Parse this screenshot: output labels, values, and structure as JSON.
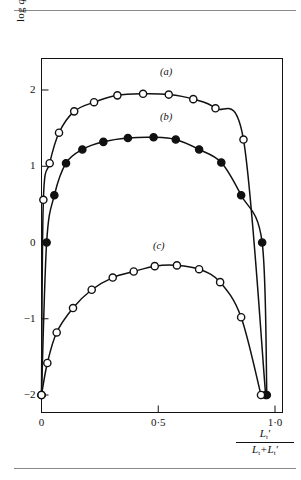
{
  "figure": {
    "y_axis_title_main": "log",
    "y_axis_title_var": "q",
    "x_axis_numerator": "L",
    "x_axis_numerator_sub": "t",
    "x_axis_denominator_a": "L",
    "x_axis_denominator_a_sub": "t",
    "x_axis_denominator_plus": "+",
    "x_axis_denominator_b": "L",
    "x_axis_denominator_b_sub": "t"
  },
  "chart_data": {
    "type": "line",
    "title": "",
    "xlabel": "L't / (Lt + L't)",
    "ylabel": "log q",
    "xlim": [
      0,
      1
    ],
    "ylim": [
      -2.35,
      2.6
    ],
    "grid": false,
    "legend": "inline-curve-labels",
    "xticks": [
      0,
      0.5,
      1
    ],
    "xtick_labels": [
      "0",
      "0·5",
      "1·0"
    ],
    "yticks": [
      2,
      1,
      0,
      -1,
      -2
    ],
    "ytick_labels": [
      "2",
      "1",
      "0",
      "−1",
      "−2"
    ],
    "annotations": [
      {
        "text": "(a)",
        "x": 0.55,
        "y": 2.22
      },
      {
        "text": "(b)",
        "x": 0.55,
        "y": 1.63
      },
      {
        "text": "(c)",
        "x": 0.52,
        "y": -0.06
      }
    ],
    "series": [
      {
        "name": "(a)",
        "marker": "open-circle",
        "marker_size": 6,
        "points": [
          {
            "x": 0.0,
            "y": -2.0
          },
          {
            "x": 0.008,
            "y": 0.56
          },
          {
            "x": 0.035,
            "y": 1.04
          },
          {
            "x": 0.075,
            "y": 1.44
          },
          {
            "x": 0.14,
            "y": 1.72
          },
          {
            "x": 0.225,
            "y": 1.84
          },
          {
            "x": 0.325,
            "y": 1.93
          },
          {
            "x": 0.435,
            "y": 1.95
          },
          {
            "x": 0.545,
            "y": 1.94
          },
          {
            "x": 0.65,
            "y": 1.88
          },
          {
            "x": 0.745,
            "y": 1.76
          },
          {
            "x": 0.865,
            "y": 1.35
          },
          {
            "x": 0.96,
            "y": -2.0
          }
        ]
      },
      {
        "name": "(b)",
        "marker": "filled-circle",
        "marker_size": 6,
        "points": [
          {
            "x": 0.0,
            "y": -2.0
          },
          {
            "x": 0.022,
            "y": 0.0
          },
          {
            "x": 0.055,
            "y": 0.62
          },
          {
            "x": 0.105,
            "y": 1.04
          },
          {
            "x": 0.175,
            "y": 1.22
          },
          {
            "x": 0.265,
            "y": 1.32
          },
          {
            "x": 0.37,
            "y": 1.37
          },
          {
            "x": 0.48,
            "y": 1.38
          },
          {
            "x": 0.575,
            "y": 1.35
          },
          {
            "x": 0.675,
            "y": 1.22
          },
          {
            "x": 0.77,
            "y": 1.05
          },
          {
            "x": 0.855,
            "y": 0.62
          },
          {
            "x": 0.945,
            "y": 0.0
          },
          {
            "x": 0.965,
            "y": -2.0
          }
        ]
      },
      {
        "name": "(c)",
        "marker": "open-circle",
        "marker_size": 6,
        "points": [
          {
            "x": 0.0,
            "y": -2.0
          },
          {
            "x": 0.025,
            "y": -1.58
          },
          {
            "x": 0.065,
            "y": -1.18
          },
          {
            "x": 0.135,
            "y": -0.86
          },
          {
            "x": 0.215,
            "y": -0.62
          },
          {
            "x": 0.305,
            "y": -0.46
          },
          {
            "x": 0.395,
            "y": -0.38
          },
          {
            "x": 0.485,
            "y": -0.31
          },
          {
            "x": 0.58,
            "y": -0.3
          },
          {
            "x": 0.675,
            "y": -0.35
          },
          {
            "x": 0.765,
            "y": -0.52
          },
          {
            "x": 0.855,
            "y": -0.98
          },
          {
            "x": 0.94,
            "y": -2.0
          }
        ]
      }
    ]
  }
}
